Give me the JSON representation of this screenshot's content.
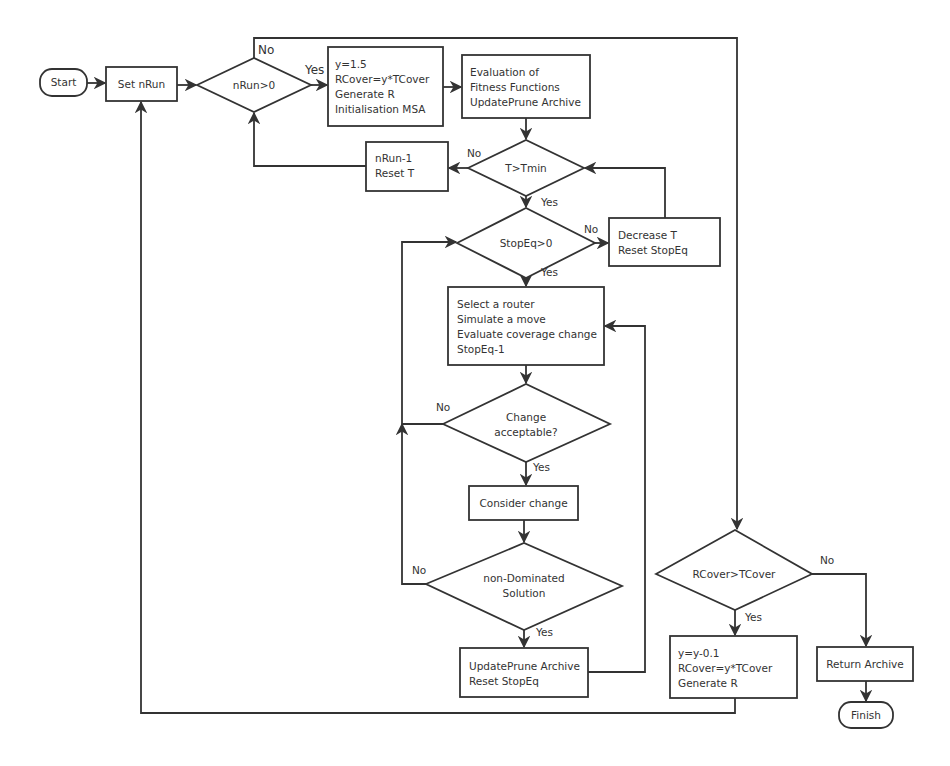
{
  "diagram": {
    "type": "flowchart",
    "nodes": {
      "start": {
        "label": "Start"
      },
      "set_nrun": {
        "label": "Set nRun"
      },
      "nrun_gt_0": {
        "label": "nRun>0"
      },
      "init": {
        "lines": [
          "y=1.5",
          "RCover=y*TCover",
          "Generate R",
          "Initialisation MSA"
        ]
      },
      "evaluation": {
        "lines": [
          "Evaluation of",
          "Fitness Functions",
          "UpdatePrune Archive"
        ]
      },
      "t_gt_tmin": {
        "label": "T>Tmin"
      },
      "nrun_dec": {
        "lines": [
          "nRun-1",
          "Reset T"
        ]
      },
      "stopeq_gt_0": {
        "label": "StopEq>0"
      },
      "decrease_t": {
        "lines": [
          "Decrease T",
          "Reset StopEq"
        ]
      },
      "select_router": {
        "lines": [
          "Select a router",
          "Simulate a move",
          "Evaluate coverage change",
          "StopEq-1"
        ]
      },
      "change_acceptable": {
        "lines": [
          "Change",
          "acceptable?"
        ]
      },
      "consider_change": {
        "label": "Consider change"
      },
      "non_dominated": {
        "lines": [
          "non-Dominated",
          "Solution"
        ]
      },
      "update_prune": {
        "lines": [
          "UpdatePrune Archive",
          "Reset StopEq"
        ]
      },
      "rcover_gt_tcover": {
        "label": "RCover>TCover"
      },
      "y_dec": {
        "lines": [
          "y=y-0.1",
          "RCover=y*TCover",
          "Generate R"
        ]
      },
      "return_archive": {
        "label": "Return Archive"
      },
      "finish": {
        "label": "Finish"
      }
    },
    "edge_labels": {
      "nrun_no": "No",
      "nrun_yes": "Yes",
      "tmin_no": "No",
      "tmin_yes": "Yes",
      "stopeq_no": "No",
      "stopeq_yes": "Yes",
      "accept_no": "No",
      "accept_yes": "Yes",
      "nondom_no": "No",
      "nondom_yes": "Yes",
      "rcover_no": "No",
      "rcover_yes": "Yes"
    },
    "edges": [
      {
        "from": "Start",
        "to": "Set nRun"
      },
      {
        "from": "Set nRun",
        "to": "nRun>0"
      },
      {
        "from": "nRun>0",
        "to": "y=1.5 ...",
        "label": "Yes"
      },
      {
        "from": "nRun>0",
        "to": "RCover>TCover",
        "label": "No"
      },
      {
        "from": "y=1.5 ...",
        "to": "Evaluation of Fitness Functions"
      },
      {
        "from": "Evaluation of Fitness Functions",
        "to": "T>Tmin"
      },
      {
        "from": "T>Tmin",
        "to": "nRun-1 Reset T",
        "label": "No"
      },
      {
        "from": "nRun-1 Reset T",
        "to": "nRun>0"
      },
      {
        "from": "T>Tmin",
        "to": "StopEq>0",
        "label": "Yes"
      },
      {
        "from": "StopEq>0",
        "to": "Decrease T Reset StopEq",
        "label": "No"
      },
      {
        "from": "Decrease T Reset StopEq",
        "to": "T>Tmin"
      },
      {
        "from": "StopEq>0",
        "to": "Select a router ...",
        "label": "Yes"
      },
      {
        "from": "Select a router ...",
        "to": "Change acceptable?"
      },
      {
        "from": "Change acceptable?",
        "to": "StopEq>0",
        "label": "No"
      },
      {
        "from": "Change acceptable?",
        "to": "Consider change",
        "label": "Yes"
      },
      {
        "from": "Consider change",
        "to": "non-Dominated Solution"
      },
      {
        "from": "non-Dominated Solution",
        "to": "StopEq>0",
        "label": "No"
      },
      {
        "from": "non-Dominated Solution",
        "to": "UpdatePrune Archive Reset StopEq",
        "label": "Yes"
      },
      {
        "from": "UpdatePrune Archive Reset StopEq",
        "to": "Select a router ..."
      },
      {
        "from": "RCover>TCover",
        "to": "y=y-0.1 ...",
        "label": "Yes"
      },
      {
        "from": "RCover>TCover",
        "to": "Return Archive",
        "label": "No"
      },
      {
        "from": "y=y-0.1 ...",
        "to": "Set nRun"
      },
      {
        "from": "Return Archive",
        "to": "Finish"
      }
    ]
  }
}
